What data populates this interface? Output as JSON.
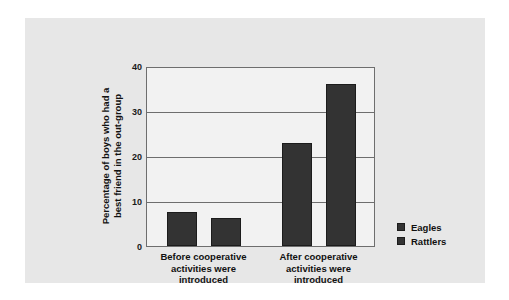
{
  "chart_data": {
    "type": "bar",
    "title": "",
    "subtitle": "",
    "xlabel": "",
    "ylabel": "Percentage of boys who had a best friend in the out-group",
    "ylabel_lines": [
      "Percentage of boys who had a",
      "best friend in the out-group"
    ],
    "categories": [
      "Before cooperative activities were introduced",
      "After cooperative activities were introduced"
    ],
    "category_lines": [
      [
        "Before cooperative",
        "activities were",
        "introduced"
      ],
      [
        "After cooperative",
        "activities were",
        "introduced"
      ]
    ],
    "series": [
      {
        "name": "Eagles",
        "values": [
          7.5,
          23
        ]
      },
      {
        "name": "Rattlers",
        "values": [
          6.2,
          36
        ]
      }
    ],
    "ylim": [
      0,
      40
    ],
    "yticks": [
      0,
      10,
      20,
      30,
      40
    ],
    "ytick_labels": [
      "0",
      "10",
      "20",
      "30",
      "40"
    ],
    "grid": true,
    "legend_position": "right",
    "colors": {
      "bar": "#333333",
      "bar_edge": "#1c1c1c",
      "panel_background": "#e7e7e7",
      "plot_background": "#f2f2f2",
      "axis": "#6e6e6e",
      "text": "#111111",
      "figure_background": "#ffffff"
    }
  },
  "legend": {
    "items": [
      {
        "label": "Eagles"
      },
      {
        "label": "Rattlers"
      }
    ]
  },
  "yaxis": {
    "ticks": [
      {
        "label": "40"
      },
      {
        "label": "30"
      },
      {
        "label": "20"
      },
      {
        "label": "10"
      },
      {
        "label": "0"
      }
    ]
  }
}
